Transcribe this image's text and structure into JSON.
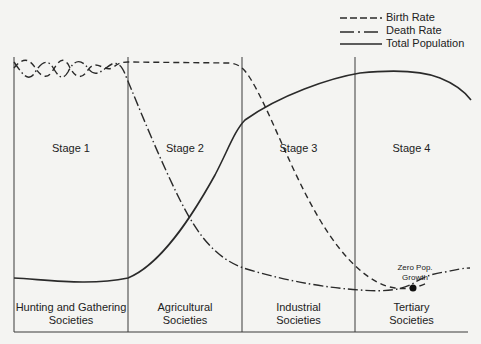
{
  "legend": {
    "birth_rate": "Birth Rate",
    "death_rate": "Death Rate",
    "total_population": "Total Population"
  },
  "stages": [
    {
      "label": "Stage 1",
      "society_line1": "Hunting and Gathering",
      "society_line2": "Societies"
    },
    {
      "label": "Stage 2",
      "society_line1": "Agricultural",
      "society_line2": "Societies"
    },
    {
      "label": "Stage 3",
      "society_line1": "Industrial",
      "society_line2": "Societies"
    },
    {
      "label": "Stage 4",
      "society_line1": "Tertiary",
      "society_line2": "Societies"
    }
  ],
  "annotation": {
    "line1": "Zero Pop.",
    "line2": "Growth"
  },
  "colors": {
    "line": "#2a2a2a",
    "background": "#f4f4f2"
  }
}
